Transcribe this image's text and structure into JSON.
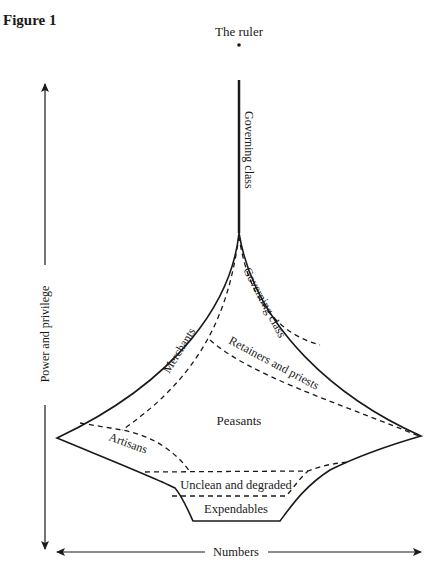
{
  "figure": {
    "title": "Figure 1"
  },
  "diagram": {
    "ruler_label": "The ruler",
    "governing_class_top": "Governing class",
    "governing_class_inner": "Governing class",
    "merchants": "Merchants",
    "retainers": "Retainers and priests",
    "peasants": "Peasants",
    "artisans": "Artisans",
    "unclean": "Unclean and degraded",
    "expendables": "Expendables"
  },
  "axes": {
    "y_label": "Power and privilege",
    "x_label": "Numbers"
  },
  "colors": {
    "ink": "#1a1a1a",
    "background": "#ffffff"
  }
}
